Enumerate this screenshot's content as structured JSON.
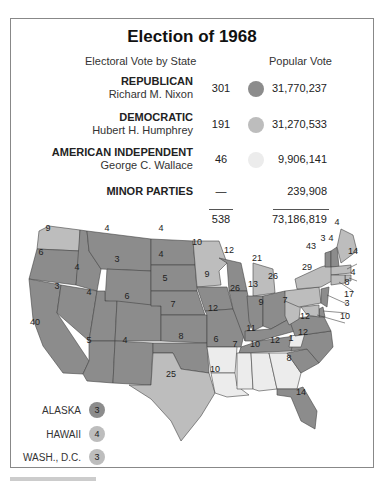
{
  "title": "Election of 1968",
  "subtitles": {
    "electoral": "Electoral Vote by State",
    "popular": "Popular Vote"
  },
  "colors": {
    "republican": "#8c8c8c",
    "democratic": "#bdbdbd",
    "american_independent": "#ececec",
    "border": "#444444"
  },
  "parties": [
    {
      "party": "REPUBLICAN",
      "candidate": "Richard M. Nixon",
      "electoral": "301",
      "popular": "31,770,237",
      "color": "#8c8c8c"
    },
    {
      "party": "DEMOCRATIC",
      "candidate": "Hubert H. Humphrey",
      "electoral": "191",
      "popular": "31,270,533",
      "color": "#bdbdbd"
    },
    {
      "party": "AMERICAN INDEPENDENT",
      "candidate": "George C. Wallace",
      "electoral": "46",
      "popular": "9,906,141",
      "color": "#ececec"
    },
    {
      "party": "MINOR PARTIES",
      "candidate": "",
      "electoral": "—",
      "popular": "239,908"
    }
  ],
  "totals": {
    "electoral": "538",
    "popular": "73,186,819"
  },
  "map_labels": [
    {
      "state": "WA",
      "ev": "9"
    },
    {
      "state": "OR",
      "ev": "6"
    },
    {
      "state": "CA",
      "ev": "40"
    },
    {
      "state": "ID",
      "ev": "4"
    },
    {
      "state": "NV",
      "ev": "3"
    },
    {
      "state": "MT",
      "ev": "4"
    },
    {
      "state": "WY",
      "ev": "3"
    },
    {
      "state": "UT",
      "ev": "4"
    },
    {
      "state": "CO",
      "ev": "6"
    },
    {
      "state": "AZ",
      "ev": "5"
    },
    {
      "state": "NM",
      "ev": "4"
    },
    {
      "state": "ND",
      "ev": "4"
    },
    {
      "state": "SD",
      "ev": "4"
    },
    {
      "state": "NE",
      "ev": "5"
    },
    {
      "state": "KS",
      "ev": "7"
    },
    {
      "state": "OK",
      "ev": "8"
    },
    {
      "state": "TX",
      "ev": "25"
    },
    {
      "state": "MN",
      "ev": "10"
    },
    {
      "state": "IA",
      "ev": "9"
    },
    {
      "state": "MO",
      "ev": "12"
    },
    {
      "state": "AR",
      "ev": "6"
    },
    {
      "state": "LA",
      "ev": "10"
    },
    {
      "state": "WI",
      "ev": "12"
    },
    {
      "state": "IL",
      "ev": "26"
    },
    {
      "state": "MI",
      "ev": "21"
    },
    {
      "state": "IN",
      "ev": "13"
    },
    {
      "state": "OH",
      "ev": "26"
    },
    {
      "state": "KY",
      "ev": "9"
    },
    {
      "state": "TN",
      "ev": "11"
    },
    {
      "state": "MS",
      "ev": "7"
    },
    {
      "state": "AL",
      "ev": "10"
    },
    {
      "state": "GA",
      "ev": "12"
    },
    {
      "state": "FL",
      "ev": "14"
    },
    {
      "state": "SC",
      "ev": "8"
    },
    {
      "state": "NC-W",
      "ev": "1"
    },
    {
      "state": "NC",
      "ev": "12"
    },
    {
      "state": "VA",
      "ev": "12"
    },
    {
      "state": "WV",
      "ev": "7"
    },
    {
      "state": "PA",
      "ev": "29"
    },
    {
      "state": "NY",
      "ev": "43"
    },
    {
      "state": "VT",
      "ev": "3"
    },
    {
      "state": "NH",
      "ev": "4"
    },
    {
      "state": "ME",
      "ev": "4"
    },
    {
      "state": "MA",
      "ev": "14"
    },
    {
      "state": "RI",
      "ev": "4"
    },
    {
      "state": "CT",
      "ev": "8"
    },
    {
      "state": "NJ",
      "ev": "17"
    },
    {
      "state": "DE",
      "ev": "3"
    },
    {
      "state": "MD",
      "ev": "10"
    }
  ],
  "legend": [
    {
      "label": "ALASKA",
      "ev": "3",
      "color": "#8c8c8c"
    },
    {
      "label": "HAWAII",
      "ev": "4",
      "color": "#bdbdbd"
    },
    {
      "label": "WASH., D.C.",
      "ev": "3",
      "color": "#bdbdbd"
    }
  ]
}
